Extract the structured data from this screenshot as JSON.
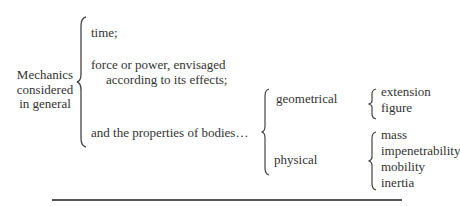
{
  "root": {
    "label_lines": [
      "Mechanics",
      "considered",
      "in general"
    ]
  },
  "branches": [
    {
      "text": "time;"
    },
    {
      "text_lines": [
        "force or power, envisaged",
        "according to its effects;"
      ]
    },
    {
      "text": "and the properties of bodies…"
    }
  ],
  "properties": {
    "geometrical": {
      "label": "geometrical",
      "items": [
        "extension",
        "figure"
      ]
    },
    "physical": {
      "label": "physical",
      "items": [
        "mass",
        "impenetrability",
        "mobility",
        "inertia"
      ]
    }
  }
}
